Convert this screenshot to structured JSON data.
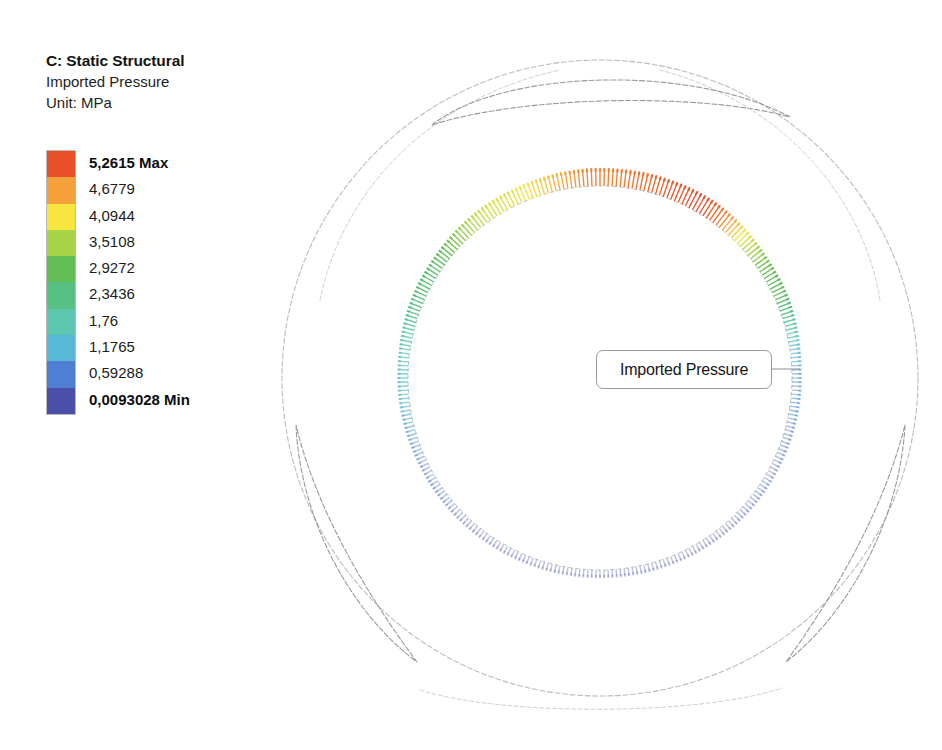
{
  "window": {
    "title": "C: Static Structural",
    "width": 942,
    "height": 750,
    "background": "#ffffff"
  },
  "legend": {
    "title": "C: Static Structural",
    "result_name": "Imported Pressure",
    "unit_line": "Unit: MPa",
    "unit": "MPa",
    "max_label": "5,2615 Max",
    "min_label": "0,0093028 Min",
    "max_value": 5.2615,
    "min_value": 0.0093028,
    "band_count": 10,
    "ticks": [
      {
        "label": "5,2615 Max",
        "value": 5.2615,
        "bold": true,
        "color": "#e8502a"
      },
      {
        "label": "4,6779",
        "value": 4.6779,
        "bold": false,
        "color": "#f4a13c"
      },
      {
        "label": "4,0944",
        "value": 4.0944,
        "bold": false,
        "color": "#f6e63f"
      },
      {
        "label": "3,5108",
        "value": 3.5108,
        "bold": false,
        "color": "#a8d44a"
      },
      {
        "label": "2,9272",
        "value": 2.9272,
        "bold": false,
        "color": "#62bf53"
      },
      {
        "label": "2,3436",
        "value": 2.3436,
        "bold": false,
        "color": "#57c183"
      },
      {
        "label": "1,76",
        "value": 1.76,
        "bold": false,
        "color": "#5cc6ae"
      },
      {
        "label": "1,1765",
        "value": 1.1765,
        "bold": false,
        "color": "#59b7d8"
      },
      {
        "label": "0,59288",
        "value": 0.59288,
        "bold": false,
        "color": "#4f7fd4"
      },
      {
        "label": "0,0093028 Min",
        "value": 0.0093028,
        "bold": true,
        "color": "#4b4fa8"
      }
    ],
    "band_colors_top_to_bottom": [
      "#e8502a",
      "#f4a13c",
      "#f6e63f",
      "#a8d44a",
      "#62bf53",
      "#57c183",
      "#5cc6ae",
      "#59b7d8",
      "#4f7fd4",
      "#4b4fa8"
    ]
  },
  "annotation": {
    "label": "Imported Pressure",
    "leader_from_x": 772,
    "leader_to_x": 800
  },
  "model": {
    "outline_color": "#b4b4b4",
    "center_x": 600,
    "center_y": 378,
    "outer_radius": 318,
    "bore_radius": 192,
    "spoke_count": 3,
    "spoke_label": "curved-spoke-slot"
  },
  "chart_data": {
    "type": "contour",
    "title": "C: Static Structural",
    "subtitle": "Imported Pressure",
    "unit": "MPa",
    "legend_min": 0.0093028,
    "legend_max": 5.2615,
    "legend_levels": [
      0.0093028,
      0.59288,
      1.1765,
      1.76,
      2.3436,
      2.9272,
      3.5108,
      4.0944,
      4.6779,
      5.2615
    ],
    "angles_deg": [
      0,
      30,
      60,
      90,
      120,
      150,
      180,
      210,
      240,
      270,
      300,
      330
    ],
    "pressure_by_angle": [
      0.9,
      0.35,
      0.06,
      0.01,
      0.05,
      0.45,
      1.35,
      2.6,
      3.9,
      4.9,
      5.26,
      2.9
    ]
  }
}
